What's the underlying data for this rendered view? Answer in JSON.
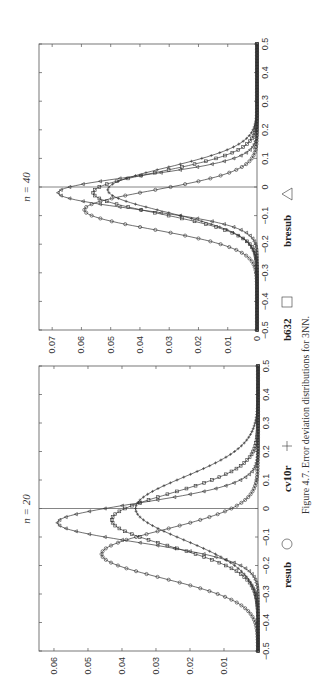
{
  "caption": "Figure 4.7.  Error deviation distributions for 3NN.",
  "legend": [
    {
      "label": "resub",
      "marker": "circle"
    },
    {
      "label": "cv10r",
      "marker": "plus"
    },
    {
      "label": "b632",
      "marker": "square"
    },
    {
      "label": "bresub",
      "marker": "triangle"
    }
  ],
  "chart_data": [
    {
      "type": "line",
      "title": "n = 20",
      "xlabel": "",
      "ylabel": "",
      "xlim": [
        -0.5,
        0.5
      ],
      "ylim": [
        0,
        0.064
      ],
      "xticks": [
        "-0.5",
        "-0.4",
        "-0.3",
        "-0.2",
        "-0.1",
        "0",
        "0.1",
        "0.2",
        "0.3",
        "0.4",
        "0.5"
      ],
      "yticks": [
        "0.01",
        "0.02",
        "0.03",
        "0.04",
        "0.05",
        "0.06"
      ],
      "vertical_line_at_x": 0,
      "series": [
        {
          "name": "resub",
          "marker": "circle",
          "peak_x": -0.16,
          "peak_y": 0.046,
          "sigma": 0.085
        },
        {
          "name": "cv10r",
          "marker": "plus",
          "peak_x": 0.0,
          "peak_y": 0.036,
          "sigma": 0.11
        },
        {
          "name": "b632",
          "marker": "square",
          "peak_x": -0.04,
          "peak_y": 0.043,
          "sigma": 0.092
        },
        {
          "name": "bresub",
          "marker": "triangle",
          "peak_x": -0.05,
          "peak_y": 0.059,
          "sigma": 0.068
        }
      ]
    },
    {
      "type": "line",
      "title": "n = 40",
      "xlabel": "",
      "ylabel": "",
      "xlim": [
        -0.5,
        0.5
      ],
      "ylim": [
        0,
        0.075
      ],
      "xticks": [
        "-0.5",
        "-0.4",
        "-0.3",
        "-0.2",
        "-0.1",
        "0",
        "0.1",
        "0.2",
        "0.3",
        "0.4",
        "0.5"
      ],
      "yticks": [
        "0",
        "0.01",
        "0.02",
        "0.03",
        "0.04",
        "0.05",
        "0.06",
        "0.07"
      ],
      "vertical_line_at_x": 0,
      "series": [
        {
          "name": "resub",
          "marker": "circle",
          "peak_x": -0.08,
          "peak_y": 0.059,
          "sigma": 0.068
        },
        {
          "name": "cv10r",
          "marker": "plus",
          "peak_x": -0.01,
          "peak_y": 0.051,
          "sigma": 0.078
        },
        {
          "name": "b632",
          "marker": "square",
          "peak_x": -0.02,
          "peak_y": 0.056,
          "sigma": 0.072
        },
        {
          "name": "bresub",
          "marker": "triangle",
          "peak_x": -0.02,
          "peak_y": 0.068,
          "sigma": 0.058
        }
      ]
    }
  ]
}
